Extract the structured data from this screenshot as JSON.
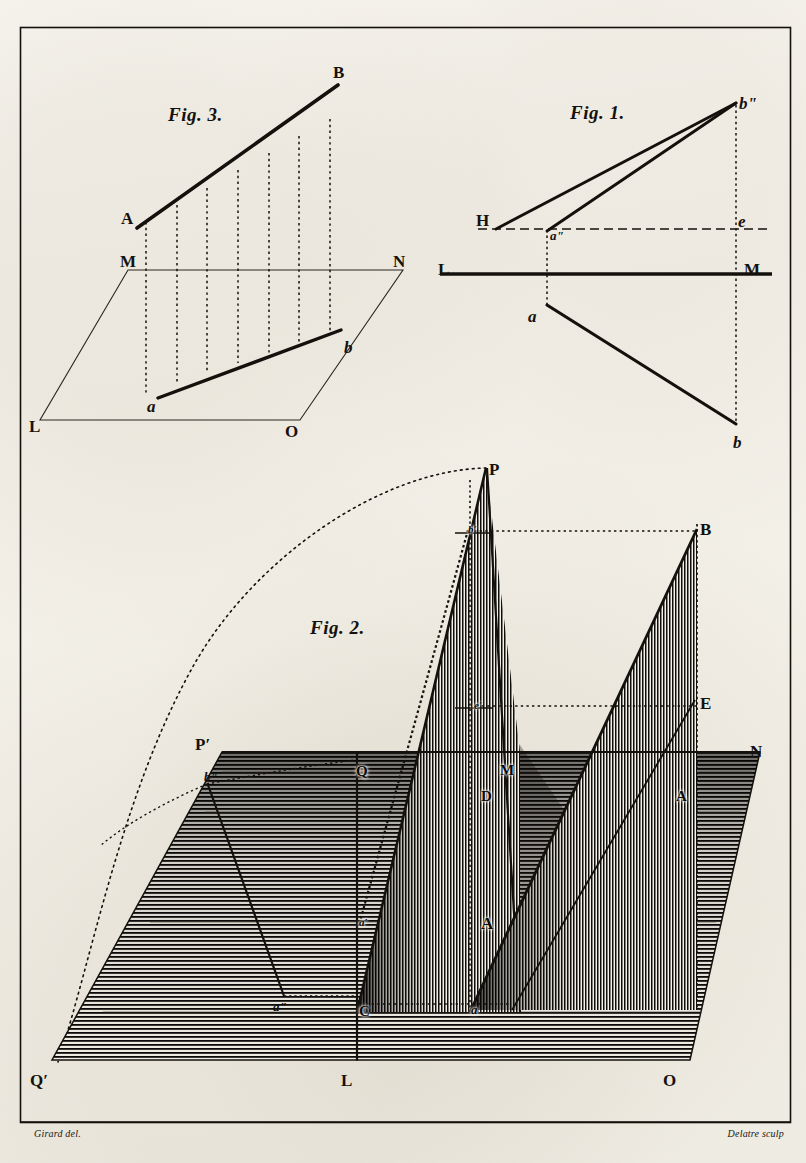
{
  "plate": {
    "kind": "engraved-plate",
    "subject": "descriptive geometry — projection of a line onto planes",
    "background_color": "#f4f2ec",
    "ink_color": "#14110d",
    "border_color": "#14110d"
  },
  "credits": {
    "draftsman": "Girard del.",
    "engraver": "Delatre sculp"
  },
  "figures": [
    {
      "id": "fig3",
      "caption": "Fig. 3.",
      "caption_pos": {
        "x": 168,
        "y": 105
      },
      "description": "Oblique line AB above ground plane LMNO with its projection ab and seven dotted ordinates",
      "labels": [
        {
          "text": "B",
          "style": "rom",
          "x": 333,
          "y": 64
        },
        {
          "text": "A",
          "style": "rom",
          "x": 121,
          "y": 210
        },
        {
          "text": "M",
          "style": "rom",
          "x": 120,
          "y": 253
        },
        {
          "text": "N",
          "style": "rom",
          "x": 393,
          "y": 253
        },
        {
          "text": "L",
          "style": "rom",
          "x": 29,
          "y": 418
        },
        {
          "text": "O",
          "style": "rom",
          "x": 285,
          "y": 423
        },
        {
          "text": "a",
          "style": "ital",
          "x": 147,
          "y": 398
        },
        {
          "text": "b",
          "style": "ital",
          "x": 344,
          "y": 339
        }
      ],
      "ordinate_count": 7
    },
    {
      "id": "fig1",
      "caption": "Fig. 1.",
      "caption_pos": {
        "x": 570,
        "y": 103
      },
      "description": "Two-plane (orthographic) projection: ground line LM, horizontal trace H–b'' above and a–b below",
      "labels": [
        {
          "text": "bʺ",
          "style": "ital",
          "x": 739,
          "y": 95
        },
        {
          "text": "H",
          "style": "rom",
          "x": 476,
          "y": 212
        },
        {
          "text": "e",
          "style": "ital",
          "x": 738,
          "y": 213
        },
        {
          "text": "aʺ",
          "style": "ital sm",
          "x": 550,
          "y": 229
        },
        {
          "text": "L",
          "style": "rom",
          "x": 438,
          "y": 261
        },
        {
          "text": "M",
          "style": "rom",
          "x": 744,
          "y": 261
        },
        {
          "text": "a",
          "style": "ital",
          "x": 528,
          "y": 308
        },
        {
          "text": "b",
          "style": "ital",
          "x": 733,
          "y": 434
        }
      ]
    },
    {
      "id": "fig2",
      "caption": "Fig. 2.",
      "caption_pos": {
        "x": 310,
        "y": 618
      },
      "description": "Perspective: ground plane Q'P'–L–O with two shaded vertical planes, oblique lines and a dotted rotation arc from P through P' to Q'",
      "labels": [
        {
          "text": "P",
          "style": "rom",
          "x": 489,
          "y": 461
        },
        {
          "text": "B",
          "style": "rom",
          "x": 700,
          "y": 521
        },
        {
          "text": "b′",
          "style": "ital xs",
          "x": 468,
          "y": 524,
          "onhatch": true
        },
        {
          "text": "E",
          "style": "rom",
          "x": 700,
          "y": 695
        },
        {
          "text": "e′",
          "style": "ital xs",
          "x": 474,
          "y": 700,
          "onhatch": true
        },
        {
          "text": "P′",
          "style": "rom",
          "x": 195,
          "y": 736
        },
        {
          "text": "N",
          "style": "rom",
          "x": 750,
          "y": 743
        },
        {
          "text": "M",
          "style": "rom sm",
          "x": 500,
          "y": 763,
          "onhatch": true
        },
        {
          "text": "Q",
          "style": "rom sm",
          "x": 356,
          "y": 764,
          "onhatch": true
        },
        {
          "text": "bʺ",
          "style": "ital sm",
          "x": 204,
          "y": 770
        },
        {
          "text": "D",
          "style": "rom sm",
          "x": 481,
          "y": 789,
          "onhatch": true
        },
        {
          "text": "A",
          "style": "rom sm",
          "x": 676,
          "y": 789,
          "onhatch": true
        },
        {
          "text": "a′",
          "style": "ital xs",
          "x": 359,
          "y": 917,
          "onhatch": true
        },
        {
          "text": "A",
          "style": "rom",
          "x": 481,
          "y": 915,
          "onhatch": true
        },
        {
          "text": "aʺ",
          "style": "ital sm",
          "x": 273,
          "y": 1000
        },
        {
          "text": "C",
          "style": "rom sm",
          "x": 359,
          "y": 1004,
          "onhatch": true
        },
        {
          "text": "a",
          "style": "ital sm",
          "x": 471,
          "y": 1003,
          "onhatch": true
        },
        {
          "text": "Q′",
          "style": "rom",
          "x": 30,
          "y": 1072
        },
        {
          "text": "L",
          "style": "rom",
          "x": 341,
          "y": 1072
        },
        {
          "text": "O",
          "style": "rom",
          "x": 663,
          "y": 1072
        }
      ]
    }
  ]
}
